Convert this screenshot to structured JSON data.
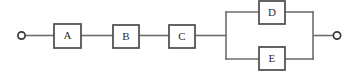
{
  "diagram": {
    "type": "reliability-block-diagram",
    "title": "",
    "canvas": {
      "width": 359,
      "height": 73,
      "background": "#ffffff"
    },
    "colors": {
      "wire": "#6e6e6e",
      "block_border": "#4a4a4a",
      "block_fill": "#ffffff",
      "terminal_border": "#3a3a3a",
      "label_text": "#2b2b2b"
    },
    "terminals": [
      {
        "name": "left-terminal",
        "label": "",
        "cx": 21.5,
        "cy": 35.5,
        "r": 3.6
      },
      {
        "name": "right-terminal",
        "label": "",
        "cx": 337.0,
        "cy": 35.5,
        "r": 3.6
      }
    ],
    "blocks": [
      {
        "id": "A",
        "label": "A",
        "x": 54,
        "y": 24,
        "w": 27,
        "h": 24,
        "branch": "series"
      },
      {
        "id": "B",
        "label": "B",
        "x": 113,
        "y": 25,
        "w": 26,
        "h": 23,
        "branch": "series"
      },
      {
        "id": "C",
        "label": "C",
        "x": 169,
        "y": 25,
        "w": 26,
        "h": 23,
        "branch": "series"
      },
      {
        "id": "D",
        "label": "D",
        "x": 259,
        "y": 1,
        "w": 26,
        "h": 23,
        "branch": "parallel-top"
      },
      {
        "id": "E",
        "label": "E",
        "x": 259,
        "y": 47,
        "w": 26,
        "h": 23,
        "branch": "parallel-bottom"
      }
    ],
    "wires": [
      {
        "name": "wire-terminal-to-a",
        "points": "25.1,35.5 54,35.5"
      },
      {
        "name": "wire-a-to-b",
        "points": "81,35.5 113,35.5"
      },
      {
        "name": "wire-b-to-c",
        "points": "139,35.5 169,35.5"
      },
      {
        "name": "wire-c-to-split",
        "points": "195,35.5 226,35.5"
      },
      {
        "name": "wire-split-vertical",
        "points": "226,12 226,59"
      },
      {
        "name": "wire-split-top-to-d",
        "points": "226,12 259,12"
      },
      {
        "name": "wire-split-bottom-to-e",
        "points": "226,59 259,59"
      },
      {
        "name": "wire-d-to-join-top",
        "points": "285,12 313,12"
      },
      {
        "name": "wire-e-to-join-bottom",
        "points": "285,59 313,59"
      },
      {
        "name": "wire-join-vertical",
        "points": "313,12 313,59"
      },
      {
        "name": "wire-join-to-terminal",
        "points": "313,35.5 333.4,35.5"
      }
    ],
    "geometry": {
      "main_line_y": 35.5,
      "top_branch_y": 12,
      "bottom_branch_y": 59,
      "split_x": 226,
      "join_x": 313
    }
  }
}
